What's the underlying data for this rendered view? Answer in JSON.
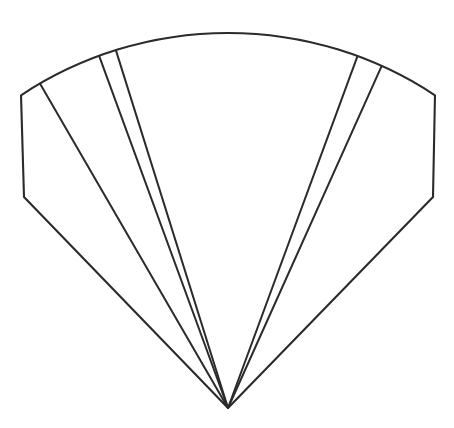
{
  "figure": {
    "title": "Folding hand fan outline",
    "kind": "line-drawing",
    "background_color": "#ffffff",
    "stroke_color": "#2b2b2b",
    "stroke_width": 2.1,
    "canvas": {
      "width": 454,
      "height": 428
    }
  },
  "geometry": {
    "apex": {
      "x": 228,
      "y": 408
    },
    "outer_radius": 375,
    "corner_radius": 293,
    "left_corner": {
      "x": 24,
      "y": 197
    },
    "right_corner": {
      "x": 433,
      "y": 197
    },
    "arc_top": {
      "x": 224,
      "y": 33
    },
    "arc_start_angle_deg": -134,
    "arc_end_angle_deg": -46,
    "rib_count": 7
  },
  "chart_data": {
    "type": "pie",
    "title": "Folding hand fan outline",
    "subtitle": "",
    "xlabel": "",
    "ylabel": "",
    "legend_position": "none",
    "grid": false,
    "center": {
      "x": 228,
      "y": 408
    },
    "radius": 375,
    "sector_start_angle_deg": -134,
    "sector_end_angle_deg": -46,
    "categories": [
      "left-flank",
      "panel-1",
      "sliver-1",
      "wide-panel",
      "sliver-2",
      "panel-2",
      "right-flank"
    ],
    "values": [
      14,
      10,
      3,
      37.5,
      4,
      15,
      14
    ],
    "annotations": [
      "apex converges at bottom center",
      "outer boundary is a circular arc",
      "left and right ends are truncated by straight chords"
    ]
  },
  "ribs": [
    {
      "name": "rib-left-edge",
      "angle_deg": -134.0,
      "length": 293,
      "note": "left outer guard stick"
    },
    {
      "name": "rib-1",
      "angle_deg": -120.1,
      "length": 375,
      "note": "first fold line"
    },
    {
      "name": "rib-2",
      "angle_deg": -110.1,
      "length": 375,
      "note": "narrow sliver left edge"
    },
    {
      "name": "rib-3",
      "angle_deg": -107.4,
      "length": 375,
      "note": "narrow sliver right edge"
    },
    {
      "name": "rib-4",
      "angle_deg": -69.8,
      "length": 375,
      "note": "narrow sliver left edge"
    },
    {
      "name": "rib-5",
      "angle_deg": -65.8,
      "length": 375,
      "note": "narrow sliver right edge"
    },
    {
      "name": "rib-right-edge",
      "angle_deg": -46.0,
      "length": 293,
      "note": "right outer guard stick"
    }
  ],
  "panels": [
    {
      "name": "panel-left-flank",
      "start_angle_deg": -134.0,
      "end_angle_deg": -120.1
    },
    {
      "name": "panel-1",
      "start_angle_deg": -120.1,
      "end_angle_deg": -110.1
    },
    {
      "name": "panel-sliver-1",
      "start_angle_deg": -110.1,
      "end_angle_deg": -107.4
    },
    {
      "name": "panel-wide",
      "start_angle_deg": -107.4,
      "end_angle_deg": -69.8
    },
    {
      "name": "panel-sliver-2",
      "start_angle_deg": -69.8,
      "end_angle_deg": -65.8
    },
    {
      "name": "panel-2",
      "start_angle_deg": -65.8,
      "end_angle_deg": -46.0
    },
    {
      "name": "panel-right-flank",
      "start_angle_deg": -46.0,
      "end_angle_deg": -46.0
    }
  ]
}
